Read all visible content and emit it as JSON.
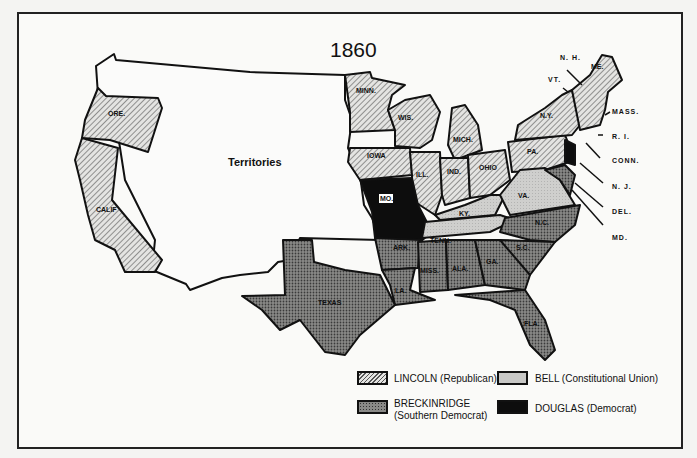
{
  "title": "1860",
  "territories_label": "Territories",
  "states": {
    "ore": "ORE.",
    "calif": "CALIF",
    "minn": "MINN.",
    "wis": "WIS.",
    "mich": "MICH.",
    "iowa": "IOWA",
    "ill": "ILL.",
    "ind": "IND.",
    "ohio": "OHIO",
    "pa": "PA.",
    "ny": "N.Y.",
    "me": "ME.",
    "mo": "MO.",
    "ky": "KY.",
    "va": "VA.",
    "tenn": "TENN.",
    "nc": "N.C.",
    "sc": "S.C.",
    "ark": "ARK.",
    "texas": "TEXAS",
    "la": "LA.",
    "miss": "MISS.",
    "ala": "ALA.",
    "ga": "GA.",
    "fla": "FLA."
  },
  "callouts": {
    "nh": "N. H.",
    "vt": "VT.",
    "mass": "MASS.",
    "ri": "R. I.",
    "conn": "CONN.",
    "nj": "N. J.",
    "del": "DEL.",
    "md": "MD."
  },
  "legend": [
    {
      "id": "lincoln",
      "label": "LINCOLN  (Republican)",
      "pattern": "diagonal-hatch"
    },
    {
      "id": "bell",
      "label": "BELL  (Constitutional Union)",
      "pattern": "light-gray"
    },
    {
      "id": "breckinridge",
      "label": "BRECKINRIDGE",
      "sublabel": "(Southern Democrat)",
      "pattern": "dark-stipple"
    },
    {
      "id": "douglas",
      "label": "DOUGLAS  (Democrat)",
      "pattern": "solid-black"
    }
  ],
  "colors": {
    "lincoln_bg": "#d8d8d6",
    "bell": "#c4c4c2",
    "breckinridge": "#7a7a78",
    "douglas": "#0d0d0d"
  }
}
